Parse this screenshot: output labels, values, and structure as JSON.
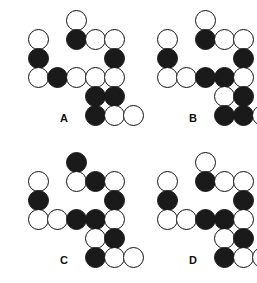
{
  "figure": {
    "type": "multiple-choice-pattern-panels",
    "panel_count": 4,
    "grid_columns": 2,
    "grid_rows": 2,
    "colors": {
      "background": "#ffffff",
      "filled_node": "#1a1a1a",
      "open_node": "#ffffff",
      "outline": "#111111",
      "label_text": "#111111"
    },
    "node_geometry": {
      "diameter": 21,
      "cell_size": 19,
      "stroke_width": 1.6
    },
    "legend": {
      "filled_meaning": "filled circle",
      "open_meaning": "open circle"
    }
  },
  "panels": [
    {
      "label": "A",
      "origin_x": 28,
      "origin_y": 10,
      "nodes": [
        {
          "col": 2,
          "row": 0,
          "fill": "open"
        },
        {
          "col": 2,
          "row": 1,
          "fill": "filled"
        },
        {
          "col": 3,
          "row": 1,
          "fill": "open"
        },
        {
          "col": 4,
          "row": 1,
          "fill": "open"
        },
        {
          "col": 0,
          "row": 1,
          "fill": "open"
        },
        {
          "col": 0,
          "row": 2,
          "fill": "filled"
        },
        {
          "col": 4,
          "row": 2,
          "fill": "filled"
        },
        {
          "col": 0,
          "row": 3,
          "fill": "open"
        },
        {
          "col": 1,
          "row": 3,
          "fill": "filled"
        },
        {
          "col": 2,
          "row": 3,
          "fill": "open"
        },
        {
          "col": 3,
          "row": 3,
          "fill": "open"
        },
        {
          "col": 4,
          "row": 3,
          "fill": "open"
        },
        {
          "col": 3,
          "row": 4,
          "fill": "filled"
        },
        {
          "col": 4,
          "row": 4,
          "fill": "filled"
        },
        {
          "col": 3,
          "row": 5,
          "fill": "filled"
        },
        {
          "col": 4,
          "row": 5,
          "fill": "open"
        },
        {
          "col": 5,
          "row": 5,
          "fill": "open"
        }
      ]
    },
    {
      "label": "B",
      "origin_x": 28,
      "origin_y": 10,
      "nodes": [
        {
          "col": 2,
          "row": 0,
          "fill": "open"
        },
        {
          "col": 2,
          "row": 1,
          "fill": "filled"
        },
        {
          "col": 3,
          "row": 1,
          "fill": "open"
        },
        {
          "col": 4,
          "row": 1,
          "fill": "open"
        },
        {
          "col": 0,
          "row": 1,
          "fill": "open"
        },
        {
          "col": 0,
          "row": 2,
          "fill": "filled"
        },
        {
          "col": 4,
          "row": 2,
          "fill": "filled"
        },
        {
          "col": 0,
          "row": 3,
          "fill": "open"
        },
        {
          "col": 1,
          "row": 3,
          "fill": "open"
        },
        {
          "col": 2,
          "row": 3,
          "fill": "filled"
        },
        {
          "col": 3,
          "row": 3,
          "fill": "filled"
        },
        {
          "col": 4,
          "row": 3,
          "fill": "open"
        },
        {
          "col": 3,
          "row": 4,
          "fill": "open"
        },
        {
          "col": 4,
          "row": 4,
          "fill": "filled"
        },
        {
          "col": 3,
          "row": 5,
          "fill": "filled"
        },
        {
          "col": 4,
          "row": 5,
          "fill": "filled"
        },
        {
          "col": 5,
          "row": 5,
          "fill": "open"
        }
      ]
    },
    {
      "label": "C",
      "origin_x": 28,
      "origin_y": 10,
      "nodes": [
        {
          "col": 2,
          "row": 0,
          "fill": "filled"
        },
        {
          "col": 2,
          "row": 1,
          "fill": "open"
        },
        {
          "col": 3,
          "row": 1,
          "fill": "filled"
        },
        {
          "col": 4,
          "row": 1,
          "fill": "open"
        },
        {
          "col": 0,
          "row": 1,
          "fill": "open"
        },
        {
          "col": 0,
          "row": 2,
          "fill": "filled"
        },
        {
          "col": 4,
          "row": 2,
          "fill": "filled"
        },
        {
          "col": 0,
          "row": 3,
          "fill": "open"
        },
        {
          "col": 1,
          "row": 3,
          "fill": "open"
        },
        {
          "col": 2,
          "row": 3,
          "fill": "filled"
        },
        {
          "col": 3,
          "row": 3,
          "fill": "filled"
        },
        {
          "col": 4,
          "row": 3,
          "fill": "open"
        },
        {
          "col": 3,
          "row": 4,
          "fill": "open"
        },
        {
          "col": 4,
          "row": 4,
          "fill": "filled"
        },
        {
          "col": 3,
          "row": 5,
          "fill": "filled"
        },
        {
          "col": 4,
          "row": 5,
          "fill": "open"
        },
        {
          "col": 5,
          "row": 5,
          "fill": "open"
        }
      ]
    },
    {
      "label": "D",
      "origin_x": 28,
      "origin_y": 10,
      "nodes": [
        {
          "col": 2,
          "row": 0,
          "fill": "open"
        },
        {
          "col": 2,
          "row": 1,
          "fill": "filled"
        },
        {
          "col": 3,
          "row": 1,
          "fill": "open"
        },
        {
          "col": 4,
          "row": 1,
          "fill": "open"
        },
        {
          "col": 0,
          "row": 1,
          "fill": "open"
        },
        {
          "col": 0,
          "row": 2,
          "fill": "filled"
        },
        {
          "col": 4,
          "row": 2,
          "fill": "filled"
        },
        {
          "col": 0,
          "row": 3,
          "fill": "open"
        },
        {
          "col": 1,
          "row": 3,
          "fill": "open"
        },
        {
          "col": 2,
          "row": 3,
          "fill": "filled"
        },
        {
          "col": 3,
          "row": 3,
          "fill": "filled"
        },
        {
          "col": 4,
          "row": 3,
          "fill": "open"
        },
        {
          "col": 3,
          "row": 4,
          "fill": "open"
        },
        {
          "col": 4,
          "row": 4,
          "fill": "filled"
        },
        {
          "col": 3,
          "row": 5,
          "fill": "filled"
        },
        {
          "col": 4,
          "row": 5,
          "fill": "open"
        },
        {
          "col": 5,
          "row": 5,
          "fill": "open"
        }
      ]
    }
  ],
  "panel_positions": [
    {
      "left": 0,
      "top": 0
    },
    {
      "left": 129,
      "top": 0
    },
    {
      "left": 0,
      "top": 142
    },
    {
      "left": 129,
      "top": 142
    }
  ],
  "label_offsets": {
    "top": 112
  }
}
